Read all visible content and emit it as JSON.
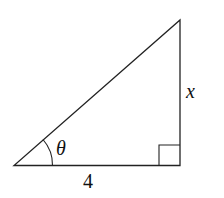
{
  "diagram": {
    "type": "right-triangle",
    "labels": {
      "angle": "θ",
      "opposite_side": "x",
      "adjacent_side": "4"
    },
    "right_angle_marker": true,
    "stroke_color": "#222222"
  }
}
